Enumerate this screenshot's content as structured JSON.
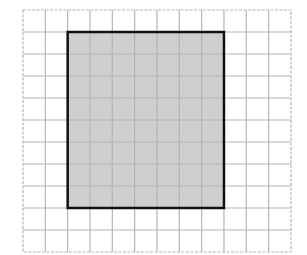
{
  "diagram": {
    "type": "grid-with-shaded-rectangle",
    "grid": {
      "columns": 12,
      "rows": 11,
      "left": 23,
      "top": 10,
      "cell_width": 22.33,
      "cell_height": 22,
      "line_color": "#b5b5b5",
      "border_style": "dashed"
    },
    "shaded_rectangle": {
      "col_start": 2,
      "row_start": 1,
      "width_cells": 7,
      "height_cells": 8,
      "fill_color": "#cfcfcf",
      "border_color": "#111111",
      "border_width": 2.5
    },
    "background_color": "#ffffff"
  }
}
